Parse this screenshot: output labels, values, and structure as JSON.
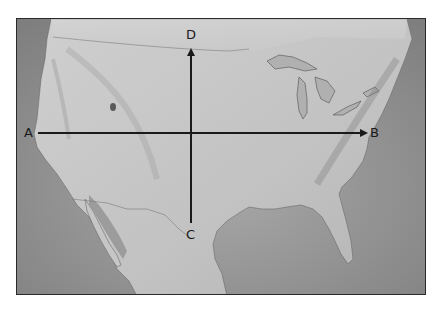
{
  "map": {
    "subject": "United States cross-section reference map",
    "style": "grayscale shaded relief",
    "colors": {
      "land": "#c4c4c4",
      "water": "#8e8e8e",
      "frame": "#2a2a2a",
      "arrow": "#1a1a1a",
      "label": "#1a1a1a"
    }
  },
  "points": {
    "A": {
      "label": "A"
    },
    "B": {
      "label": "B"
    },
    "C": {
      "label": "C"
    },
    "D": {
      "label": "D"
    }
  },
  "lines": [
    {
      "from": "A",
      "to": "B",
      "orientation": "horizontal",
      "arrowhead": "B"
    },
    {
      "from": "C",
      "to": "D",
      "orientation": "vertical",
      "arrowhead": "D"
    }
  ]
}
